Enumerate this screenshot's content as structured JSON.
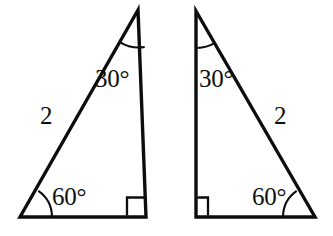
{
  "figure": {
    "background_color": "#ffffff",
    "stroke_color": "#0d0d0d",
    "degree_symbol": "°"
  },
  "triangles": [
    {
      "id": "left-triangle",
      "orientation": "right-angle-at-bottom-right",
      "vertices": {
        "apex": {
          "x": 138,
          "y": 10
        },
        "bottom_left": {
          "x": 20,
          "y": 217
        },
        "bottom_right": {
          "x": 146,
          "y": 217
        }
      },
      "apex_angle_label": "30°",
      "base_angle_label": "60°",
      "right_angle_label": "90°",
      "hypotenuse_label": "2"
    },
    {
      "id": "right-triangle",
      "orientation": "right-angle-at-bottom-left",
      "vertices": {
        "apex": {
          "x": 196,
          "y": 11
        },
        "bottom_left": {
          "x": 196,
          "y": 217
        },
        "bottom_right": {
          "x": 315,
          "y": 217
        }
      },
      "apex_angle_label": "30°",
      "base_angle_label": "60°",
      "right_angle_label": "90°",
      "hypotenuse_label": "2"
    }
  ]
}
